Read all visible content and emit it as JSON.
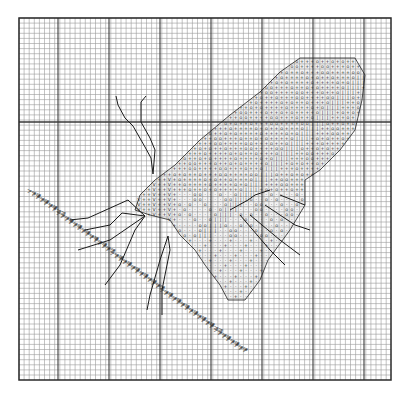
{
  "page": {
    "background": "#ffffff"
  },
  "grid": {
    "left_px": 19,
    "top_px": 18,
    "right_px": 391,
    "bottom_px": 380,
    "cell_px": 5.1,
    "cols": 73,
    "rows": 71,
    "minor_line_color": "#9a9a9a",
    "major_line_color": "#3a3a3a",
    "border_color": "#2a2a2a",
    "major_vertical_x_px": [
      58,
      109,
      160,
      211,
      262,
      313,
      364
    ],
    "major_horizontal_y_px": [
      122
    ],
    "major_line_note": "Only the vertical major lines and the single horizontal major line at y~122 were measured from zooms; intermediate horizontal majors were not clearly resolved."
  },
  "legend_symbols": [
    {
      "glyph": "+",
      "meaning": "stitch color A"
    },
    {
      "glyph": "o",
      "meaning": "stitch color B"
    },
    {
      "glyph": "·",
      "meaning": "stitch color C"
    },
    {
      "glyph": "|",
      "meaning": "stitch color D"
    },
    {
      "glyph": "V",
      "meaning": "stitch color E"
    },
    {
      "glyph": "S",
      "meaning": "stitch color F"
    },
    {
      "glyph": ">",
      "meaning": "grass stem stitch"
    }
  ],
  "fidelity": {
    "measured": [
      "outer grid bounds",
      "cell size (~5.1px)",
      "vertical major-line positions",
      "horizontal major line at y~122",
      "approximate wing outline",
      "antenna and leg line paths",
      "grass stem diagonal extent"
    ],
    "reconstructed_not_transcribed": [
      "per-cell symbol assignments inside the wing",
      "exact positions of individual > marks along the stem"
    ],
    "note": "The wing holds roughly a thousand stitch symbols. I sampled about a dozen zoomed regions but did not record each cell's coordinates, so the symbol fill is drawn by a pattern that follows the observed outline and banding. It is not a cell-accurate copy of the chart."
  },
  "wing": {
    "description": "Large diagonal wing running from lower-left body (~x140,y205) to upper-right tip (~x355,y60)",
    "outline_polygon_px": [
      [
        300,
        58
      ],
      [
        355,
        58
      ],
      [
        365,
        75
      ],
      [
        362,
        100
      ],
      [
        355,
        130
      ],
      [
        340,
        150
      ],
      [
        320,
        170
      ],
      [
        305,
        180
      ],
      [
        305,
        205
      ],
      [
        290,
        230
      ],
      [
        268,
        260
      ],
      [
        260,
        280
      ],
      [
        245,
        300
      ],
      [
        228,
        300
      ],
      [
        220,
        285
      ],
      [
        205,
        265
      ],
      [
        195,
        250
      ],
      [
        180,
        235
      ],
      [
        170,
        220
      ],
      [
        150,
        215
      ],
      [
        135,
        210
      ],
      [
        140,
        195
      ],
      [
        155,
        180
      ],
      [
        175,
        165
      ],
      [
        200,
        140
      ],
      [
        230,
        115
      ],
      [
        260,
        92
      ],
      [
        280,
        72
      ]
    ],
    "bands_observed": [
      {
        "region": "upper edge rows",
        "dominant": [
          "+",
          "|",
          "o"
        ]
      },
      {
        "region": "mid wing",
        "dominant": [
          "+",
          "o"
        ]
      },
      {
        "region": "row of vertical bars",
        "dominant": [
          "|"
        ]
      },
      {
        "region": "lower-left near body",
        "dominant": [
          "+",
          "V",
          "S"
        ]
      },
      {
        "region": "lower wing lobe",
        "dominant": [
          "·",
          "o",
          "+"
        ]
      }
    ]
  },
  "lines": {
    "antennae": [
      {
        "points_px": [
          [
            116,
            96
          ],
          [
            118,
            105
          ],
          [
            125,
            118
          ],
          [
            133,
            126
          ],
          [
            145,
            147
          ],
          [
            151,
            158
          ],
          [
            153,
            174
          ]
        ]
      },
      {
        "points_px": [
          [
            146,
            96
          ],
          [
            141,
            102
          ],
          [
            141,
            122
          ],
          [
            150,
            138
          ],
          [
            155,
            150
          ],
          [
            153,
            174
          ]
        ]
      }
    ],
    "legs": [
      {
        "points_px": [
          [
            145,
            216
          ],
          [
            128,
            200
          ],
          [
            88,
            218
          ],
          [
            70,
            220
          ]
        ]
      },
      {
        "points_px": [
          [
            145,
            216
          ],
          [
            122,
            213
          ],
          [
            110,
            225
          ],
          [
            85,
            230
          ]
        ]
      },
      {
        "points_px": [
          [
            145,
            216
          ],
          [
            110,
            240
          ],
          [
            78,
            250
          ]
        ]
      },
      {
        "points_px": [
          [
            145,
            216
          ],
          [
            135,
            230
          ],
          [
            120,
            265
          ],
          [
            105,
            285
          ]
        ]
      },
      {
        "points_px": [
          [
            168,
            236
          ],
          [
            160,
            260
          ],
          [
            150,
            295
          ],
          [
            147,
            310
          ]
        ]
      },
      {
        "points_px": [
          [
            168,
            236
          ],
          [
            170,
            250
          ],
          [
            162,
            290
          ],
          [
            162,
            315
          ]
        ]
      }
    ],
    "wing_veins": [
      {
        "points_px": [
          [
            270,
            190
          ],
          [
            255,
            195
          ],
          [
            248,
            200
          ],
          [
            230,
            210
          ]
        ]
      },
      {
        "points_px": [
          [
            240,
            215
          ],
          [
            270,
            250
          ],
          [
            285,
            265
          ]
        ]
      },
      {
        "points_px": [
          [
            250,
            215
          ],
          [
            280,
            240
          ],
          [
            300,
            255
          ]
        ]
      },
      {
        "points_px": [
          [
            265,
            205
          ],
          [
            295,
            225
          ],
          [
            310,
            230
          ]
        ]
      },
      {
        "points_px": [
          [
            280,
            195
          ],
          [
            305,
            205
          ]
        ]
      }
    ]
  },
  "stem": {
    "glyph": ">",
    "start_px": [
      27,
      193
    ],
    "end_px": [
      238,
      350
    ],
    "band_width_cells": 3,
    "note": "Diagonal grass stem of > stitches, 2-3 cells thick. Individual mark positions are approximated along the measured line."
  }
}
